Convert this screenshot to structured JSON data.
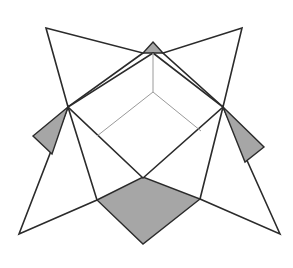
{
  "figure": {
    "title": "",
    "colors": {
      "background": "#ffffff",
      "outline": "#2b2b2b",
      "hidden_edge": "#9a9a9a",
      "tab_fill": "#a6a6a6"
    },
    "shapes": {
      "star_outline": "46,28 143,53 153,42 163,53 242,28 223,107 264,147 245,162 280,234 200,199 143,244 97,200 19,234 52,154 33,136 67,105",
      "flap_top_left": "46,28 143,53 68,107",
      "flap_top_right": "242,28 163,53 223,107",
      "flap_bottom_left": "19,234 68,107 97,200",
      "flap_bottom_right": "280,234 223,107 200,199",
      "inner_box": "153,53 223,107 143,178 68,107",
      "tab_top": "153,42 163,53 143,53",
      "tab_left": "68,107 33,136 52,154",
      "tab_right": "223,107 264,147 245,162",
      "tab_bottom": "97,200 143,177 200,199 143,244",
      "hidden_edges": [
        [
          153,
          53,
          153,
          92
        ],
        [
          153,
          92,
          97,
          136
        ],
        [
          153,
          92,
          201,
          131
        ]
      ]
    }
  }
}
